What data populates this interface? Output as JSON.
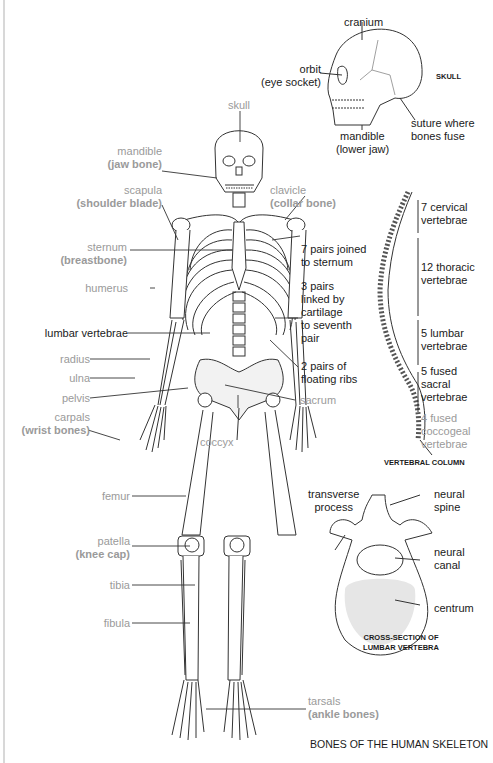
{
  "title": "BONES OF THE HUMAN SKELETON",
  "skeleton_labels": {
    "skull": "skull",
    "mandible": "mandible",
    "mandible_common": "(jaw bone)",
    "scapula": "scapula",
    "scapula_common": "(shoulder blade)",
    "clavicle": "clavicle",
    "clavicle_common": "(collar bone)",
    "sternum": "sternum",
    "sternum_common": "(breastbone)",
    "humerus": "humerus",
    "lumbar_vertebrae": "lumbar vertebrae",
    "radius": "radius",
    "ulna": "ulna",
    "pelvis": "pelvis",
    "carpals": "carpals",
    "carpals_common": "(wrist bones)",
    "sacrum": "sacrum",
    "coccyx": "coccyx",
    "femur": "femur",
    "patella": "patella",
    "patella_common": "(knee cap)",
    "tibia": "tibia",
    "fibula": "fibula",
    "tarsals": "tarsals",
    "tarsals_common": "(ankle bones)"
  },
  "ribs": {
    "true_ribs": [
      "7 pairs joined",
      "to sternum"
    ],
    "false_ribs": [
      "3 pairs",
      "linked by",
      "cartilage",
      "to seventh",
      "pair"
    ],
    "floating_ribs": [
      "2 pairs of",
      "floating ribs"
    ]
  },
  "skull_inset": {
    "caption": "SKULL",
    "cranium": "cranium",
    "orbit": "orbit",
    "orbit_common": "(eye socket)",
    "mandible": "mandible",
    "mandible_common": "(lower jaw)",
    "suture": [
      "suture where",
      "bones fuse"
    ]
  },
  "vertebral_column": {
    "caption": "VERTEBRAL COLUMN",
    "cervical": [
      "7 cervical",
      "vertebrae"
    ],
    "thoracic": [
      "12 thoracic",
      "vertebrae"
    ],
    "lumbar": [
      "5 lumbar",
      "vertebrae"
    ],
    "sacral": [
      "5 fused",
      "sacral",
      "vertebrae"
    ],
    "coccygeal": [
      "4 fused",
      "coccogeal",
      "vertebrae"
    ]
  },
  "lumbar_cross_section": {
    "caption": [
      "CROSS-SECTION OF",
      "LUMBAR VERTEBRA"
    ],
    "transverse_process": [
      "transverse",
      "process"
    ],
    "neural_spine": [
      "neural",
      "spine"
    ],
    "neural_canal": [
      "neural",
      "canal"
    ],
    "centrum": "centrum"
  }
}
